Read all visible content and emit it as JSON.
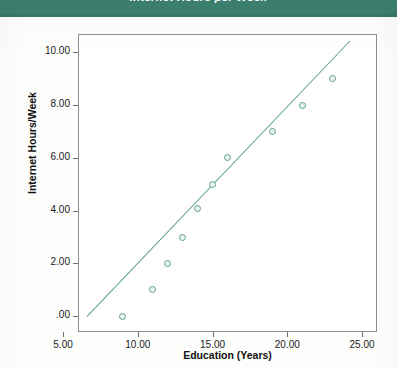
{
  "banner": {
    "title": "Internet Hours per Week"
  },
  "chart_data": {
    "type": "scatter",
    "title": "Internet Hours per Week",
    "xlabel": "Education (Years)",
    "ylabel": "Internet Hours/Week",
    "xlim": [
      6.0,
      26.0
    ],
    "ylim": [
      -0.6,
      10.7
    ],
    "grid": false,
    "legend": "none",
    "x": [
      9,
      11,
      12,
      13,
      14,
      15,
      16,
      19,
      21,
      23
    ],
    "y": [
      0.0,
      1.0,
      2.0,
      3.0,
      4.1,
      5.0,
      6.0,
      7.0,
      8.0,
      9.0
    ],
    "points": [
      {
        "x": 9,
        "y": 0.0
      },
      {
        "x": 11,
        "y": 1.0
      },
      {
        "x": 12,
        "y": 2.0
      },
      {
        "x": 13,
        "y": 3.0
      },
      {
        "x": 14,
        "y": 4.1
      },
      {
        "x": 15,
        "y": 5.0
      },
      {
        "x": 16,
        "y": 6.0
      },
      {
        "x": 19,
        "y": 7.0
      },
      {
        "x": 21,
        "y": 8.0
      },
      {
        "x": 23,
        "y": 9.0
      }
    ],
    "series": [
      {
        "name": "Internet Hours/Week",
        "marker": "open-circle",
        "color": "#5f9e92",
        "values": [
          0.0,
          1.0,
          2.0,
          3.0,
          4.1,
          5.0,
          6.0,
          7.0,
          8.0,
          9.0
        ]
      },
      {
        "name": "fit-line",
        "type": "line",
        "color": "#5f9e92",
        "x_range": [
          6.6,
          24.2
        ],
        "y_range": [
          0.0,
          10.45
        ],
        "slope": 0.594,
        "intercept": -3.92
      }
    ],
    "xticks": [
      "5.00",
      "10.00",
      "15.00",
      "20.00",
      "25.00"
    ],
    "xtick_values": [
      5,
      10,
      15,
      20,
      25
    ],
    "yticks": [
      "10.00",
      "8.00",
      "6.00",
      "4.00",
      "2.00",
      ".00"
    ],
    "ytick_values": [
      10,
      8,
      6,
      4,
      2,
      0
    ]
  },
  "colors": {
    "banner_bg": "#3c7f6e",
    "banner_text": "#ffffff",
    "marker": "#5f9e92",
    "line": "#5f9e92",
    "frame": "#8d8d8d",
    "text": "#1a1a1a"
  }
}
